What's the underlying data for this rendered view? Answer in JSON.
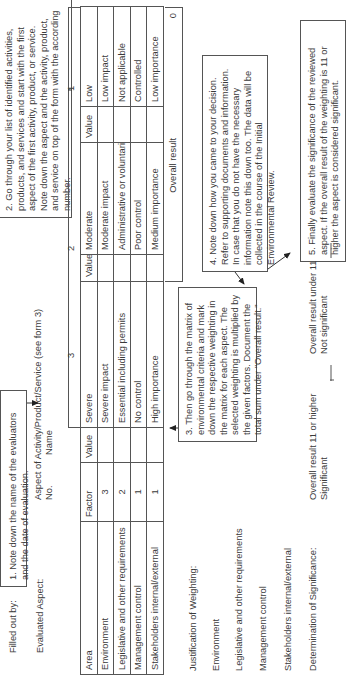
{
  "header": {
    "filled_out_by_label": "Filled out by:",
    "date_label": "Date:",
    "evaluated_aspect_label": "Evaluated Aspect:",
    "aspect_desc": "Aspect of Activity/Product/Service (see form 3)",
    "no_label": "No.",
    "name_label": "Name"
  },
  "callouts": {
    "step1": "1.  Note down the name of the evaluators and the date of evaluation.",
    "step2": "2.  Go through your list of identified activities, products, and services and start with the first aspect of the first activity, product, or service. Note down the aspect and the activity, product, and service on top of the form with the according number.",
    "step3": "3.  Then go through the matrix of environmental criteria and mark down the respective weighting in the matrix for each aspect. The selected weighting is multiplied by the given factors. Document the total sum under \"Overall result.\"",
    "step4": "4.  Note down how you came to your decision. Refer to supporting documents and information. In case that you do not have the necessary information note this down too. The data will be collected in the course of the Initial Environmental Review.",
    "step5": "5.  Finally evaluate the significance of the reviewed aspect. If the overall result of the weighting is 11 or higher the aspect is considered significant."
  },
  "matrix": {
    "band_labels": [
      "3",
      "2",
      "1"
    ],
    "columns": [
      "Area",
      "Factor",
      "Value",
      "Severe",
      "Value",
      "Moderate",
      "Value",
      "Low"
    ],
    "rows": [
      {
        "area": "Environment",
        "factor": "3",
        "value3": "",
        "severe": "Severe impact",
        "value2": "",
        "moderate": "Moderate impact",
        "value1": "",
        "low": "Low impact"
      },
      {
        "area": "Legislative and other requirements",
        "factor": "2",
        "value3": "",
        "severe": "Essential including permits",
        "value2": "",
        "moderate": "Administrative or voluntarily",
        "value1": "",
        "low": "Not applicable"
      },
      {
        "area": "Management control",
        "factor": "1",
        "value3": "",
        "severe": "No control",
        "value2": "",
        "moderate": "Poor control",
        "value1": "",
        "low": "Controlled"
      },
      {
        "area": "Stakeholders internal/external",
        "factor": "1",
        "value3": "",
        "severe": "High importance",
        "value2": "",
        "moderate": "Medium importance",
        "value1": "",
        "low": "Low importance"
      }
    ],
    "overall_label": "Overall result",
    "overall_value": "0"
  },
  "justification": {
    "title": "Justification of Weighting:",
    "items": [
      "Environment",
      "Legislative and other requirements",
      "Management control",
      "Stakeholders internal/external"
    ]
  },
  "significance": {
    "label": "Determination of Significance:",
    "significant_line1": "Overall result 11 or higher",
    "significant_line2": "Significant",
    "not_significant_line1": "Overall result under 11",
    "not_significant_line2": "Not significant"
  }
}
